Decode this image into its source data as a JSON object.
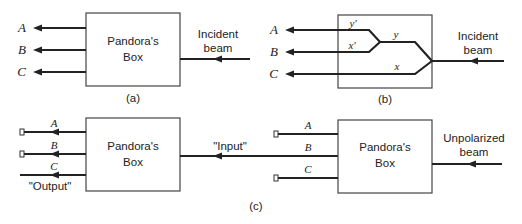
{
  "panel_a": {
    "caption": "(a)",
    "box_label_line1": "Pandora's",
    "box_label_line2": "Box",
    "input_label_line1": "Incident",
    "input_label_line2": "beam",
    "outputs": [
      "A",
      "B",
      "C"
    ]
  },
  "panel_b": {
    "caption": "(b)",
    "input_label_line1": "Incident",
    "input_label_line2": "beam",
    "outputs": [
      "A",
      "B",
      "C"
    ],
    "path_labels": {
      "y_prime": "y'",
      "x_prime": "x'",
      "y": "y",
      "x": "x"
    }
  },
  "panel_c": {
    "caption": "(c)",
    "left_box": {
      "label_line1": "Pandora's",
      "label_line2": "Box",
      "outputs": [
        "A",
        "B",
        "C"
      ],
      "output_label": "\"Output\""
    },
    "input_label": "\"Input\"",
    "right_box": {
      "label_line1": "Pandora's",
      "label_line2": "Box",
      "outputs": [
        "A",
        "B",
        "C"
      ],
      "input_label_line1": "Unpolarized",
      "input_label_line2": "beam"
    }
  }
}
